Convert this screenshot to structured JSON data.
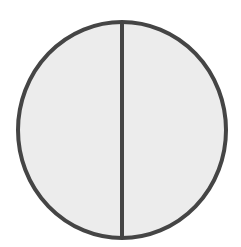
{
  "diagram": {
    "type": "circle-divided-in-half",
    "shape": {
      "cx": 122,
      "cy": 130,
      "rx": 104,
      "ry": 108,
      "fill": "#ececec",
      "stroke": "#454545",
      "stroke_width": 4
    },
    "divider": {
      "orientation": "vertical",
      "x": 122,
      "stroke": "#454545",
      "stroke_width": 4
    },
    "parts": [
      {
        "name": "left-half",
        "fraction": "1/2"
      },
      {
        "name": "right-half",
        "fraction": "1/2"
      }
    ]
  }
}
